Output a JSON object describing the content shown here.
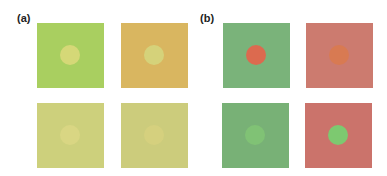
{
  "panels": [
    {
      "label": "(a)",
      "squares": [
        {
          "bg": "#a9cf60",
          "circle": "#d5d877"
        },
        {
          "bg": "#d9b660",
          "circle": "#d5d27a"
        },
        {
          "bg": "#cdd07c",
          "circle": "#d9d683"
        },
        {
          "bg": "#cccc7c",
          "circle": "#d5d07e"
        }
      ]
    },
    {
      "label": "(b)",
      "squares": [
        {
          "bg": "#7ab37a",
          "circle": "#dc6a4f"
        },
        {
          "bg": "#cc7b6f",
          "circle": "#d87a52"
        },
        {
          "bg": "#78b176",
          "circle": "#80c275"
        },
        {
          "bg": "#cb736b",
          "circle": "#7dc970"
        }
      ]
    }
  ]
}
